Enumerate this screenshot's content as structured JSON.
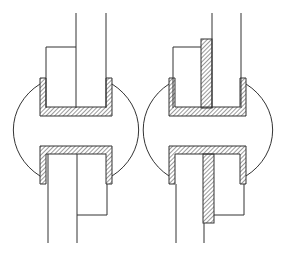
{
  "figure": {
    "stroke_color": "#333333",
    "hatch_color": "#333333",
    "background": "#ffffff",
    "panels": [
      {
        "id": "left",
        "label": "",
        "variant": "without-center-bar"
      },
      {
        "id": "right",
        "label": "",
        "variant": "with-hatched-center-bar"
      }
    ]
  }
}
